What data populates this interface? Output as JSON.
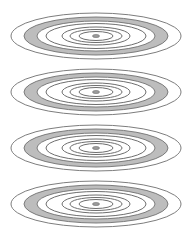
{
  "figure": {
    "width": 190,
    "height": 236,
    "background": "#ffffff",
    "line_color": "#6e6e6e",
    "band_fill": "#bdbdbd",
    "band_stroke": "#707070",
    "dot_fill": "#9a9a9a",
    "center_x": 96,
    "sets": [
      {
        "name": "ring-set-1",
        "cy": 36
      },
      {
        "name": "ring-set-2",
        "cy": 92
      },
      {
        "name": "ring-set-3",
        "cy": 148
      },
      {
        "name": "ring-set-4",
        "cy": 204
      }
    ],
    "outer_ring": {
      "rx": 85,
      "ry": 23
    },
    "band": {
      "outer_rx": 72,
      "outer_ry": 19,
      "inner_rx": 59,
      "inner_ry": 15
    },
    "rings": [
      {
        "rx": 50,
        "ry": 12.5
      },
      {
        "rx": 34,
        "ry": 9
      },
      {
        "rx": 26,
        "ry": 6.5
      },
      {
        "rx": 17,
        "ry": 4.5
      }
    ],
    "center_dot": {
      "rx": 3.5,
      "ry": 1.6
    }
  }
}
